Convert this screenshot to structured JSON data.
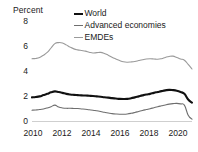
{
  "chart_data": {
    "type": "line",
    "title": "",
    "xlabel": "",
    "ylabel": "Percent",
    "ylim": [
      0,
      8
    ],
    "xlim": [
      2010,
      2020.5
    ],
    "yticks": [
      0,
      2,
      4,
      6,
      8
    ],
    "xticks": [
      2010,
      2012,
      2014,
      2016,
      2018,
      2020
    ],
    "ytick_labels": [
      "0",
      "2",
      "4",
      "6",
      "8"
    ],
    "xtick_labels": [
      "2010",
      "2012",
      "2014",
      "2016",
      "2018",
      "2020"
    ],
    "grid": false,
    "legend_position": "top-right",
    "x": [
      2010.0,
      2010.25,
      2010.5,
      2010.75,
      2011.0,
      2011.25,
      2011.5,
      2011.75,
      2012.0,
      2012.25,
      2012.5,
      2012.75,
      2013.0,
      2013.25,
      2013.5,
      2013.75,
      2014.0,
      2014.25,
      2014.5,
      2014.75,
      2015.0,
      2015.25,
      2015.5,
      2015.75,
      2016.0,
      2016.25,
      2016.5,
      2016.75,
      2017.0,
      2017.25,
      2017.5,
      2017.75,
      2018.0,
      2018.25,
      2018.5,
      2018.75,
      2019.0,
      2019.25,
      2019.5,
      2019.75,
      2020.0,
      2020.25,
      2020.5
    ],
    "series": [
      {
        "name": "World",
        "color": "#111111",
        "width": 2.1,
        "values": [
          1.92,
          1.95,
          2.0,
          2.1,
          2.2,
          2.32,
          2.4,
          2.35,
          2.28,
          2.2,
          2.15,
          2.12,
          2.1,
          2.08,
          2.07,
          2.05,
          2.03,
          2.0,
          1.97,
          1.93,
          1.9,
          1.86,
          1.83,
          1.8,
          1.79,
          1.8,
          1.85,
          1.92,
          2.0,
          2.08,
          2.15,
          2.2,
          2.28,
          2.35,
          2.42,
          2.48,
          2.52,
          2.5,
          2.45,
          2.35,
          2.2,
          1.75,
          1.5
        ]
      },
      {
        "name": "Advanced economies",
        "color": "#6e6e6e",
        "width": 1.1,
        "values": [
          0.9,
          0.92,
          0.95,
          1.0,
          1.08,
          1.18,
          1.3,
          1.15,
          1.08,
          1.05,
          1.05,
          1.04,
          1.03,
          1.0,
          0.97,
          0.93,
          0.9,
          0.85,
          0.8,
          0.73,
          0.67,
          0.63,
          0.6,
          0.58,
          0.58,
          0.6,
          0.65,
          0.72,
          0.8,
          0.88,
          0.95,
          1.02,
          1.1,
          1.18,
          1.25,
          1.32,
          1.38,
          1.42,
          1.44,
          1.4,
          1.3,
          0.5,
          0.18
        ]
      },
      {
        "name": "EMDEs",
        "color": "#9a9a9a",
        "width": 1.1,
        "values": [
          5.0,
          5.02,
          5.1,
          5.28,
          5.5,
          5.85,
          6.2,
          6.28,
          6.25,
          6.1,
          5.92,
          5.78,
          5.7,
          5.65,
          5.6,
          5.52,
          5.45,
          5.48,
          5.5,
          5.42,
          5.28,
          5.12,
          4.98,
          4.85,
          4.75,
          4.72,
          4.74,
          4.78,
          4.85,
          4.92,
          4.98,
          5.0,
          4.98,
          4.95,
          5.0,
          5.1,
          5.18,
          5.2,
          5.1,
          4.98,
          4.88,
          4.55,
          4.18
        ]
      }
    ]
  },
  "legend": {
    "items": [
      {
        "label": "World",
        "color": "#111111"
      },
      {
        "label": "Advanced economies",
        "color": "#6e6e6e"
      },
      {
        "label": "EMDEs",
        "color": "#9a9a9a"
      }
    ]
  }
}
